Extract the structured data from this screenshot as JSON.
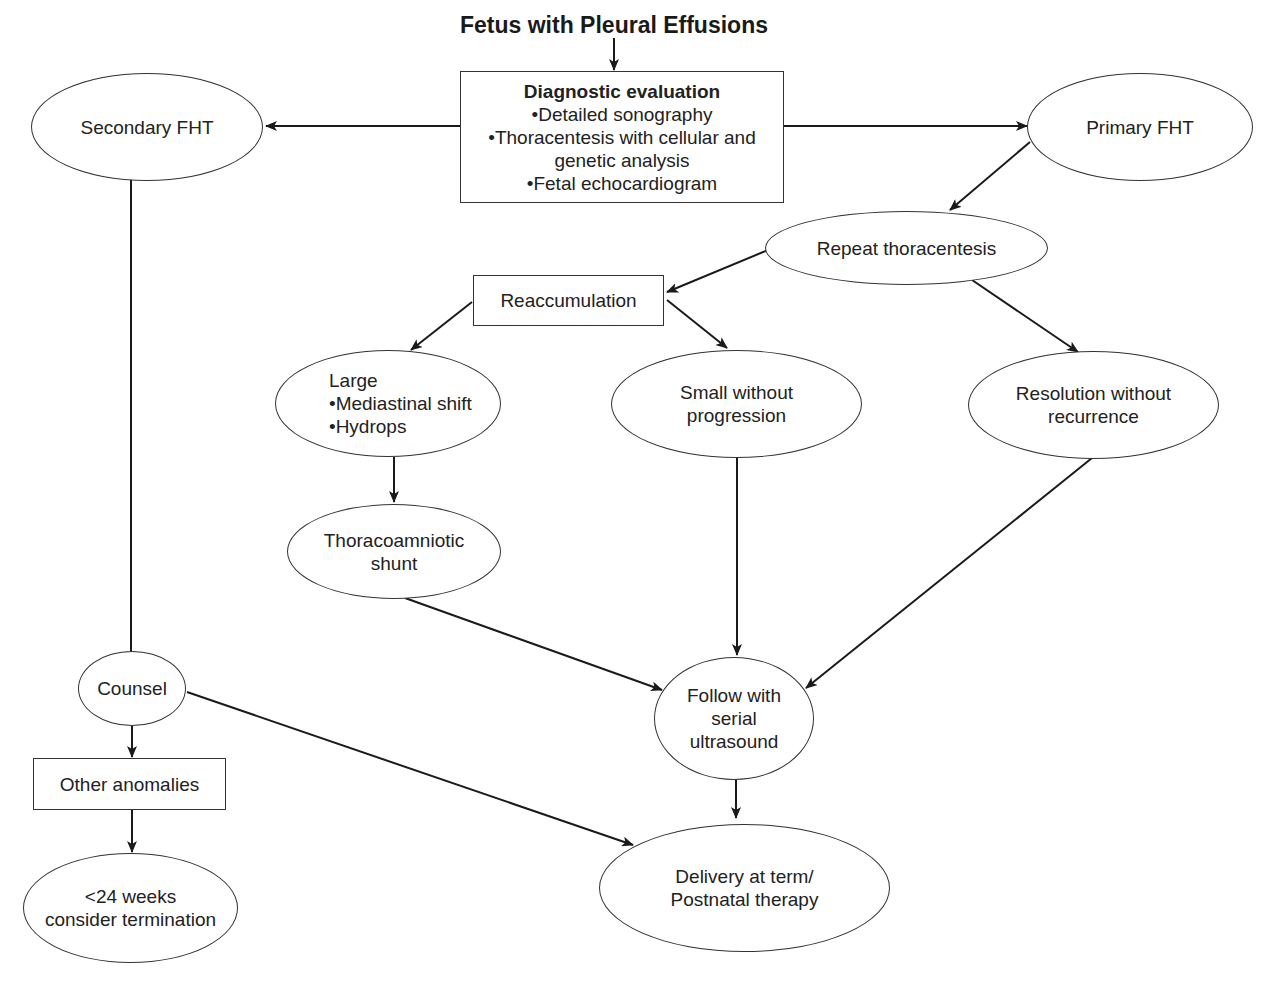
{
  "title": "Fetus with Pleural Effusions",
  "nodes": {
    "diagnostic": {
      "heading": "Diagnostic evaluation",
      "items": [
        "•Detailed sonography",
        "•Thoracentesis with cellular and",
        "genetic analysis",
        "•Fetal echocardiogram"
      ]
    },
    "secondary": {
      "label": "Secondary FHT"
    },
    "primary": {
      "label": "Primary FHT"
    },
    "repeat": {
      "label": "Repeat thoracentesis"
    },
    "reaccumulation": {
      "label": "Reaccumulation"
    },
    "large": {
      "lines": [
        "Large",
        "•Mediastinal shift",
        "•Hydrops"
      ]
    },
    "small": {
      "lines": [
        "Small without",
        "progression"
      ]
    },
    "resolution": {
      "lines": [
        "Resolution without",
        "recurrence"
      ]
    },
    "shunt": {
      "lines": [
        "Thoracoamniotic",
        "shunt"
      ]
    },
    "counsel": {
      "label": "Counsel"
    },
    "follow": {
      "lines": [
        "Follow with",
        "serial",
        "ultrasound"
      ]
    },
    "other": {
      "label": "Other anomalies"
    },
    "termination": {
      "lines": [
        "<24 weeks",
        "consider termination"
      ]
    },
    "delivery": {
      "lines": [
        "Delivery at term/",
        "Postnatal therapy"
      ]
    }
  },
  "edges": [
    {
      "from": "title",
      "to": "diagnostic"
    },
    {
      "from": "diagnostic",
      "to": "secondary"
    },
    {
      "from": "diagnostic",
      "to": "primary"
    },
    {
      "from": "primary",
      "to": "repeat"
    },
    {
      "from": "repeat",
      "to": "reaccumulation"
    },
    {
      "from": "repeat",
      "to": "resolution"
    },
    {
      "from": "reaccumulation",
      "to": "large"
    },
    {
      "from": "reaccumulation",
      "to": "small"
    },
    {
      "from": "large",
      "to": "shunt"
    },
    {
      "from": "shunt",
      "to": "follow"
    },
    {
      "from": "small",
      "to": "follow"
    },
    {
      "from": "resolution",
      "to": "follow"
    },
    {
      "from": "secondary",
      "to": "counsel"
    },
    {
      "from": "counsel",
      "to": "other"
    },
    {
      "from": "counsel",
      "to": "delivery"
    },
    {
      "from": "other",
      "to": "termination"
    },
    {
      "from": "follow",
      "to": "delivery"
    }
  ]
}
